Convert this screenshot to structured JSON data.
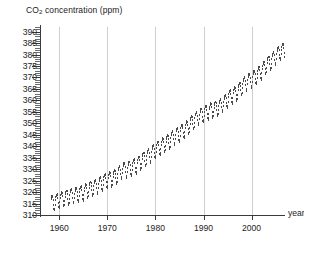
{
  "chart_data": {
    "type": "scatter",
    "title": "",
    "xlabel": "year",
    "ylabel": "CO2 concentration (ppm)",
    "ylabel_rich": {
      "prefix": "CO",
      "sub": "2",
      "suffix": " concentration (ppm)"
    },
    "xlim": [
      1956,
      2008
    ],
    "ylim": [
      310,
      392
    ],
    "ytick_labels": [
      "390",
      "385",
      "380",
      "375",
      "370",
      "365",
      "360",
      "355",
      "350",
      "345",
      "340",
      "335",
      "330",
      "325",
      "320",
      "315",
      "310"
    ],
    "ytick_values": [
      390,
      385,
      380,
      375,
      370,
      365,
      360,
      355,
      350,
      345,
      340,
      335,
      330,
      325,
      320,
      315,
      310
    ],
    "ytick_minor_step": 1,
    "xtick_labels": [
      "1960",
      "1970",
      "1980",
      "1990",
      "2000"
    ],
    "xtick_values": [
      1960,
      1970,
      1980,
      1990,
      2000
    ],
    "grid": "vertical-only",
    "gridlines_at": [
      1960,
      1970,
      1980,
      1990,
      2000
    ],
    "legend": "none",
    "marker": "small-vertical-dash",
    "series_name": "Mauna Loa monthly mean CO2",
    "seasonal_amplitude_ppm": 3.2,
    "x": [
      1958.2,
      1958.3,
      1958.4,
      1958.5,
      1958.6,
      1958.7,
      1958.8,
      1958.9,
      1959.0,
      1959.2,
      1959.4,
      1959.6,
      1959.8,
      1960.0,
      1960.2,
      1960.4,
      1960.6,
      1960.8,
      1961.0,
      1961.2,
      1961.4,
      1961.6,
      1961.8,
      1962.0,
      1962.2,
      1962.4,
      1962.6,
      1962.8,
      1963.0,
      1963.2,
      1963.4,
      1963.6,
      1963.8,
      1964.0,
      1964.2,
      1964.4,
      1964.6,
      1964.8,
      1965.0,
      1965.2,
      1965.4,
      1965.6,
      1965.8,
      1966.0,
      1966.2,
      1966.4,
      1966.6,
      1966.8,
      1967.0,
      1967.2,
      1967.4,
      1967.6,
      1967.8,
      1968.0,
      1968.2,
      1968.4,
      1968.6,
      1968.8,
      1969.0,
      1969.2,
      1969.4,
      1969.6,
      1969.8,
      1970.0,
      1970.2,
      1970.4,
      1970.6,
      1970.8,
      1971.0,
      1971.2,
      1971.4,
      1971.6,
      1971.8,
      1972.0,
      1972.2,
      1972.4,
      1972.6,
      1972.8,
      1973.0,
      1973.2,
      1973.4,
      1973.6,
      1973.8,
      1974.0,
      1974.2,
      1974.4,
      1974.6,
      1974.8,
      1975.0,
      1975.2,
      1975.4,
      1975.6,
      1975.8,
      1976.0,
      1976.2,
      1976.4,
      1976.6,
      1976.8,
      1977.0,
      1977.2,
      1977.4,
      1977.6,
      1977.8,
      1978.0,
      1978.2,
      1978.4,
      1978.6,
      1978.8,
      1979.0,
      1979.2,
      1979.4,
      1979.6,
      1979.8,
      1980.0,
      1980.2,
      1980.4,
      1980.6,
      1980.8,
      1981.0,
      1981.2,
      1981.4,
      1981.6,
      1981.8,
      1982.0,
      1982.2,
      1982.4,
      1982.6,
      1982.8,
      1983.0,
      1983.2,
      1983.4,
      1983.6,
      1983.8,
      1984.0,
      1984.2,
      1984.4,
      1984.6,
      1984.8,
      1985.0,
      1985.2,
      1985.4,
      1985.6,
      1985.8,
      1986.0,
      1986.2,
      1986.4,
      1986.6,
      1986.8,
      1987.0,
      1987.2,
      1987.4,
      1987.6,
      1987.8,
      1988.0,
      1988.2,
      1988.4,
      1988.6,
      1988.8,
      1989.0,
      1989.2,
      1989.4,
      1989.6,
      1989.8,
      1990.0,
      1990.2,
      1990.4,
      1990.6,
      1990.8,
      1991.0,
      1991.2,
      1991.4,
      1991.6,
      1991.8,
      1992.0,
      1992.2,
      1992.4,
      1992.6,
      1992.8,
      1993.0,
      1993.2,
      1993.4,
      1993.6,
      1993.8,
      1994.0,
      1994.2,
      1994.4,
      1994.6,
      1994.8,
      1995.0,
      1995.2,
      1995.4,
      1995.6,
      1995.8,
      1996.0,
      1996.2,
      1996.4,
      1996.6,
      1996.8,
      1997.0,
      1997.2,
      1997.4,
      1997.6,
      1997.8,
      1998.0,
      1998.2,
      1998.4,
      1998.6,
      1998.8,
      1999.0,
      1999.2,
      1999.4,
      1999.6,
      1999.8,
      2000.0,
      2000.2,
      2000.4,
      2000.6,
      2000.8,
      2001.0,
      2001.2,
      2001.4,
      2001.6,
      2001.8,
      2002.0,
      2002.2,
      2002.4,
      2002.6,
      2002.8,
      2003.0,
      2003.2,
      2003.4,
      2003.6,
      2003.8,
      2004.0,
      2004.2,
      2004.4,
      2004.6,
      2004.8,
      2005.0,
      2005.2,
      2005.4,
      2005.6,
      2005.8,
      2006.0,
      2006.2,
      2006.4,
      2006.6,
      2006.8
    ],
    "annual_mean": {
      "years": [
        1958,
        1959,
        1960,
        1961,
        1962,
        1963,
        1964,
        1965,
        1966,
        1967,
        1968,
        1969,
        1970,
        1971,
        1972,
        1973,
        1974,
        1975,
        1976,
        1977,
        1978,
        1979,
        1980,
        1981,
        1982,
        1983,
        1984,
        1985,
        1986,
        1987,
        1988,
        1989,
        1990,
        1991,
        1992,
        1993,
        1994,
        1995,
        1996,
        1997,
        1998,
        1999,
        2000,
        2001,
        2002,
        2003,
        2004,
        2005,
        2006
      ],
      "values": [
        315.3,
        315.9,
        316.9,
        317.6,
        318.4,
        318.9,
        319.6,
        320.0,
        321.4,
        322.2,
        323.0,
        324.6,
        325.7,
        326.3,
        327.5,
        329.7,
        330.2,
        331.1,
        332.0,
        333.8,
        335.4,
        336.8,
        338.7,
        340.1,
        341.4,
        343.0,
        344.6,
        346.0,
        347.4,
        349.2,
        351.6,
        353.1,
        354.4,
        355.6,
        356.4,
        357.1,
        358.8,
        360.8,
        362.6,
        363.7,
        366.6,
        368.3,
        369.5,
        371.0,
        373.1,
        375.6,
        377.4,
        379.6,
        381.8
      ]
    }
  },
  "colors": {
    "axis": "#3a3a3a",
    "grid": "#cfcfcf",
    "marker": "#4b4b4b",
    "text": "#1d1d1d",
    "background": "#ffffff"
  }
}
